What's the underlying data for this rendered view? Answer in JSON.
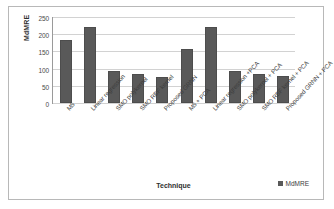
{
  "chart_data": {
    "type": "bar",
    "title": "",
    "xlabel": "Technique",
    "ylabel": "MdMRE",
    "ylim": [
      0,
      250
    ],
    "yticks": [
      0,
      50,
      100,
      150,
      200,
      250
    ],
    "grid": true,
    "legend_position": "bottom-right",
    "legend": [
      "MdMRE"
    ],
    "categories": [
      "M5",
      "Linear regression",
      "SMO polykernel",
      "SMO RBF kernel",
      "Proposed GRNN",
      "M5 + PCA",
      "Linear regression +PCA",
      "SMO polykernel + PCA",
      "SMO RBF kernel + PCA",
      "Proposed GRNN + PCA"
    ],
    "series": [
      {
        "name": "MdMRE",
        "color": "#595959",
        "values": [
          183,
          220,
          92,
          84,
          77,
          156,
          221,
          94,
          85,
          78
        ]
      }
    ]
  }
}
